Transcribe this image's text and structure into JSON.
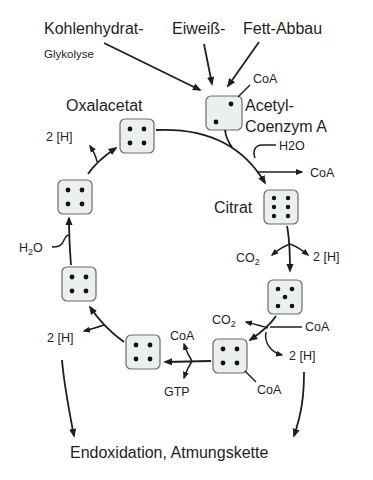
{
  "inputs": {
    "carb": "Kohlenhydrat-",
    "glycolysis": "Glykolyse",
    "protein": "Eiweiß-",
    "fat": "Fett-Abbau"
  },
  "nodes": {
    "acetyl": {
      "label_line1": "Acetyl-",
      "label_line2": "Coenzym A",
      "coa": "CoA",
      "dots": 2
    },
    "oxalacetat": {
      "label": "Oxalacetat",
      "dots": 4
    },
    "citrat": {
      "label": "Citrat",
      "dots": 6
    },
    "ketoglutarat": {
      "dots": 5
    },
    "succinyl": {
      "dots": 4,
      "coa": "CoA"
    },
    "succinat": {
      "dots": 4
    },
    "fumarat": {
      "dots": 4
    },
    "malat": {
      "dots": 4
    }
  },
  "side_products": {
    "citrat_h2o": "H2O",
    "citrat_coa": "CoA",
    "isocitrat_co2": "CO2",
    "isocitrat_2h": "2 [H]",
    "keto_co2": "CO2",
    "keto_coa": "CoA",
    "keto_2h": "2 [H]",
    "succ_coa": "CoA",
    "succ_gtp": "GTP",
    "fum_2h": "2 [H]",
    "mal_h2o": "H2O",
    "oxal_2h": "2 [H]"
  },
  "output": "Endoxidation, Atmungskette"
}
